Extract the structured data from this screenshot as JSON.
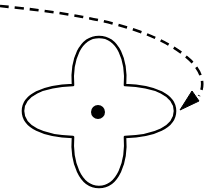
{
  "diagram": {
    "colors": {
      "background": "#ffffff",
      "stroke": "#000000",
      "fill": "#ffffff",
      "pivot": "#000000"
    },
    "shape": {
      "type": "four-lobed-clover",
      "center": [
        98,
        112
      ],
      "lobes": [
        "top",
        "right",
        "bottom",
        "left"
      ]
    },
    "pivot": {
      "center": [
        98,
        112
      ],
      "radius": 7
    },
    "arrow": {
      "style": "dashed",
      "direction": "clockwise",
      "target": "right-lobe"
    }
  }
}
